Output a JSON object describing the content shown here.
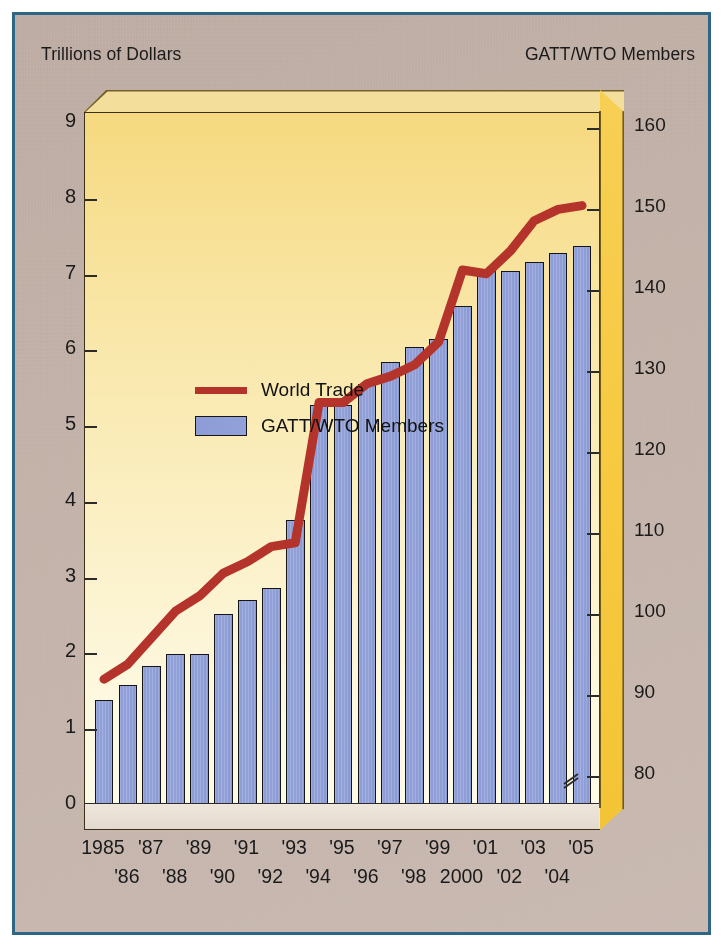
{
  "titles": {
    "left_axis": "Trillions of Dollars",
    "right_axis": "GATT/WTO Members"
  },
  "legend": {
    "items": [
      {
        "label": "World Trade",
        "marker": "line",
        "color": "#b4332a"
      },
      {
        "label": "GATT/WTO Members",
        "marker": "bar",
        "color": "#8d9cd6"
      }
    ]
  },
  "axes": {
    "left_ticks": [
      "9",
      "8",
      "7",
      "6",
      "5",
      "4",
      "3",
      "2",
      "1",
      "0"
    ],
    "right_ticks": [
      "160",
      "150",
      "140",
      "130",
      "120",
      "110",
      "100",
      "90",
      "80"
    ],
    "right_axis_break": "//"
  },
  "x_labels_row0": [
    "1985",
    "'87",
    "'89",
    "'91",
    "'93",
    "'95",
    "'97",
    "'99",
    "'01",
    "'03",
    "'05"
  ],
  "x_labels_row1": [
    "'86",
    "'88",
    "'90",
    "'92",
    "'94",
    "'96",
    "'98",
    "2000",
    "'02",
    "'04"
  ],
  "chart_data": {
    "type": "bar",
    "title": "",
    "subtitle": "",
    "xlabel": "",
    "ylabel": "Trillions of Dollars",
    "y2label": "GATT/WTO Members",
    "grid": false,
    "legend_position": "upper-left-inside",
    "ylim": [
      0,
      9
    ],
    "y2lim": [
      76.5,
      160
    ],
    "yticks": [
      0,
      1,
      2,
      3,
      4,
      5,
      6,
      7,
      8,
      9
    ],
    "y2ticks": [
      80,
      90,
      100,
      110,
      120,
      130,
      140,
      150,
      160
    ],
    "categories": [
      "1985",
      "1986",
      "1987",
      "1988",
      "1989",
      "1990",
      "1991",
      "1992",
      "1993",
      "1994",
      "1995",
      "1996",
      "1997",
      "1998",
      "1999",
      "2000",
      "2001",
      "2002",
      "2003",
      "2004",
      "2005"
    ],
    "series": [
      {
        "name": "GATT/WTO Members",
        "type": "bar",
        "axis": "right",
        "color": "#8d9cd6",
        "values": [
          90,
          92,
          94,
          96,
          96,
          99,
          101,
          102,
          111,
          125,
          125,
          128,
          130,
          132,
          133,
          139,
          144,
          144,
          145,
          147,
          148
        ]
      },
      {
        "name": "World Trade",
        "type": "line",
        "axis": "left",
        "color": "#b4332a",
        "values": [
          1.95,
          2.15,
          2.5,
          2.85,
          3.05,
          3.35,
          3.5,
          3.7,
          3.75,
          5.6,
          5.6,
          5.85,
          5.95,
          6.1,
          6.4,
          7.35,
          7.3,
          7.6,
          8.0,
          8.15,
          8.2
        ]
      }
    ],
    "bar_values_left_scale": [
      1.68,
      1.88,
      2.13,
      2.28,
      2.28,
      2.81,
      2.99,
      3.15,
      4.05,
      5.57,
      5.57,
      5.85,
      6.14,
      6.33,
      6.44,
      6.88,
      7.34,
      7.34,
      7.45,
      7.58,
      7.67
    ]
  }
}
